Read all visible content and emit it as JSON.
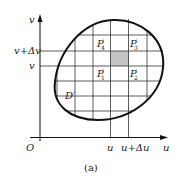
{
  "figure": {
    "caption": "(a)",
    "axes": {
      "y_label": "v",
      "x_label": "u",
      "origin_label": "O",
      "origin_prime": "′"
    },
    "y_ticks": [
      {
        "text": "v+Δv",
        "y": 51
      },
      {
        "text": "v",
        "y": 66
      }
    ],
    "x_ticks": [
      {
        "text": "u",
        "x": 110
      },
      {
        "text": "u+Δu",
        "x": 128
      }
    ],
    "region_label": "D′",
    "points": [
      {
        "name": "P",
        "sub": "1",
        "prime": "′"
      },
      {
        "name": "P",
        "sub": "2",
        "prime": "′"
      },
      {
        "name": "P",
        "sub": "3",
        "prime": "′"
      },
      {
        "name": "P",
        "sub": "4",
        "prime": "′"
      }
    ],
    "colors": {
      "line": "#1a1a1a",
      "grid": "#333333",
      "shade": "#c4c4c4"
    }
  }
}
